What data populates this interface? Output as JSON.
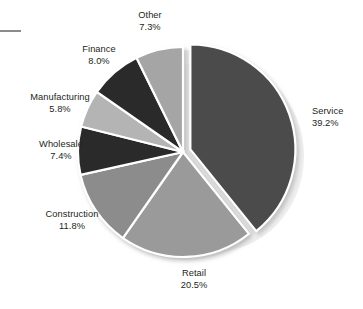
{
  "chart_data": {
    "type": "pie",
    "title": "",
    "xlabel": "",
    "ylabel": "",
    "legend_position": "none",
    "grid": false,
    "units": "%",
    "label_format": "name-above-percent",
    "start_angle_deg": 0,
    "direction": "clockwise",
    "exploded_slices": [
      "Service"
    ],
    "categories": [
      "Service",
      "Retail",
      "Construction",
      "Wholesale",
      "Manufacturing",
      "Finance",
      "Other"
    ],
    "values": [
      39.2,
      20.5,
      11.8,
      7.4,
      5.8,
      8.0,
      7.3
    ],
    "slices": [
      {
        "name": "Service",
        "value": 39.2,
        "display_value": "39.2%",
        "color": "#4c4c4c",
        "exploded": true,
        "label_position": "right"
      },
      {
        "name": "Retail",
        "value": 20.5,
        "display_value": "20.5%",
        "color": "#9a9a9a",
        "exploded": false,
        "label_position": "bottom"
      },
      {
        "name": "Construction",
        "value": 11.8,
        "display_value": "11.8%",
        "color": "#8c8c8c",
        "exploded": false,
        "label_position": "bottom-left"
      },
      {
        "name": "Wholesale",
        "value": 7.4,
        "display_value": "7.4%",
        "color": "#2b2b2b",
        "exploded": false,
        "label_position": "left"
      },
      {
        "name": "Manufacturing",
        "value": 5.8,
        "display_value": "5.8%",
        "color": "#b4b4b4",
        "exploded": false,
        "label_position": "upper-left"
      },
      {
        "name": "Finance",
        "value": 8.0,
        "display_value": "8.0%",
        "color": "#2b2b2b",
        "exploded": false,
        "label_position": "upper-left"
      },
      {
        "name": "Other",
        "value": 7.3,
        "display_value": "7.3%",
        "color": "#a5a5a5",
        "exploded": false,
        "label_position": "top"
      }
    ]
  },
  "labels": {
    "service": {
      "name": "Service",
      "pct": "39.2%"
    },
    "retail": {
      "name": "Retail",
      "pct": "20.5%"
    },
    "construction": {
      "name": "Construction",
      "pct": "11.8%"
    },
    "wholesale": {
      "name": "Wholesale",
      "pct": "7.4%"
    },
    "manufacturing": {
      "name": "Manufacturing",
      "pct": "5.8%"
    },
    "finance": {
      "name": "Finance",
      "pct": "8.0%"
    },
    "other": {
      "name": "Other",
      "pct": "7.3%"
    }
  },
  "colors": {
    "background": "#ffffff",
    "text": "#231f20",
    "slice_separator": "#ffffff",
    "shadow": "#cfcfcf",
    "corner_dash": "#8b8b8b"
  }
}
